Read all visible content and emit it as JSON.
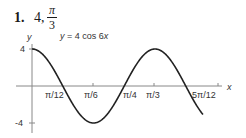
{
  "problem": {
    "number": "1.",
    "amplitude": "4,",
    "period_numerator": "π",
    "period_denominator": "3"
  },
  "chart_data": {
    "type": "line",
    "title": "y = 4 cos 6x",
    "xlabel": "x",
    "ylabel": "y",
    "function": "y = 4*cos(6*x)",
    "xlim": [
      0,
      1.13
    ],
    "ylim": [
      -4,
      4
    ],
    "x_tick_labels": [
      "π/12",
      "π/6",
      "π/4",
      "π/3",
      "5π/12"
    ],
    "y_tick_labels": [
      "4",
      "-4"
    ],
    "key_points": [
      {
        "x": "0",
        "y": 4
      },
      {
        "x": "π/12",
        "y": 0
      },
      {
        "x": "π/6",
        "y": -4
      },
      {
        "x": "π/4",
        "y": 0
      },
      {
        "x": "π/3",
        "y": 4
      },
      {
        "x": "5π/12",
        "y": 0
      }
    ],
    "grid": false,
    "legend": null
  }
}
